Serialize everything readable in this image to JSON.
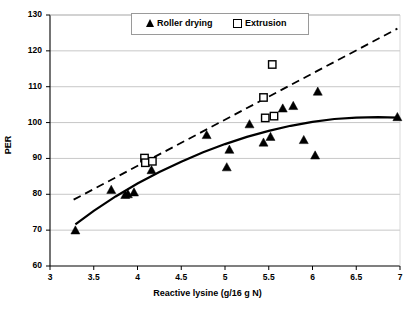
{
  "chart_data": {
    "type": "scatter",
    "title": "",
    "xlabel": "Reactive lysine (g/16 g N)",
    "ylabel": "PER",
    "xlim": [
      3,
      7
    ],
    "ylim": [
      60,
      130
    ],
    "xticks": [
      "3",
      "3.5",
      "4",
      "4.5",
      "5",
      "5.5",
      "6",
      "6.5",
      "7"
    ],
    "xtick_values": [
      3,
      3.5,
      4,
      4.5,
      5,
      5.5,
      6,
      6.5,
      7
    ],
    "yticks": [
      "60",
      "70",
      "80",
      "90",
      "100",
      "110",
      "120",
      "130"
    ],
    "ytick_values": [
      60,
      70,
      80,
      90,
      100,
      110,
      120,
      130
    ],
    "grid": "horizontal",
    "legend_position": "top-center",
    "series": [
      {
        "name": "Roller drying",
        "marker": "filled-triangle",
        "color": "#000000",
        "points": [
          [
            3.29,
            69.8
          ],
          [
            3.7,
            81.1
          ],
          [
            3.86,
            79.7
          ],
          [
            3.89,
            79.9
          ],
          [
            3.96,
            80.4
          ],
          [
            4.16,
            86.6
          ],
          [
            4.79,
            96.4
          ],
          [
            5.02,
            87.4
          ],
          [
            5.05,
            92.3
          ],
          [
            5.28,
            99.4
          ],
          [
            5.44,
            94.3
          ],
          [
            5.52,
            95.9
          ],
          [
            5.66,
            103.8
          ],
          [
            5.78,
            104.5
          ],
          [
            5.9,
            95.0
          ],
          [
            6.03,
            90.7
          ],
          [
            6.06,
            108.5
          ],
          [
            6.97,
            101.4
          ]
        ]
      },
      {
        "name": "Extrusion",
        "marker": "open-square",
        "color": "#000000",
        "points": [
          [
            4.08,
            90.1
          ],
          [
            4.09,
            88.8
          ],
          [
            4.17,
            89.2
          ],
          [
            5.44,
            107.0
          ],
          [
            5.46,
            101.3
          ],
          [
            5.54,
            116.2
          ],
          [
            5.56,
            101.8
          ]
        ]
      }
    ],
    "trendlines": [
      {
        "name": "Roller drying trend",
        "style": "solid",
        "color": "#000000",
        "points": [
          [
            3.29,
            71.6
          ],
          [
            3.5,
            75.4
          ],
          [
            3.75,
            79.4
          ],
          [
            4.0,
            83.0
          ],
          [
            4.25,
            86.2
          ],
          [
            4.5,
            89.1
          ],
          [
            4.75,
            91.7
          ],
          [
            5.0,
            94.0
          ],
          [
            5.25,
            96.0
          ],
          [
            5.5,
            97.7
          ],
          [
            5.75,
            99.1
          ],
          [
            6.0,
            100.2
          ],
          [
            6.25,
            101.0
          ],
          [
            6.5,
            101.4
          ],
          [
            6.75,
            101.5
          ],
          [
            6.97,
            101.4
          ]
        ]
      },
      {
        "name": "Extrusion trend",
        "style": "dashed",
        "color": "#000000",
        "points": [
          [
            3.27,
            78.5
          ],
          [
            6.97,
            126.2
          ]
        ]
      }
    ]
  },
  "axes": {
    "ylabel": "PER",
    "xlabel": "Reactive lysine (g/16 g N)"
  },
  "legend": {
    "roller_label": "Roller drying",
    "extrusion_label": "Extrusion"
  }
}
